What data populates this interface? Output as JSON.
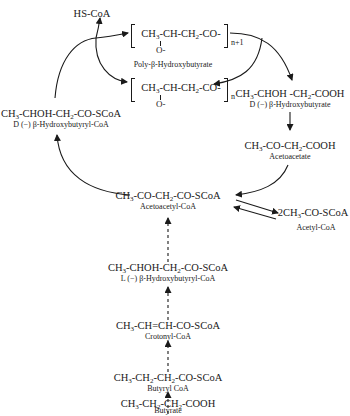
{
  "nodes": {
    "hs_coa": {
      "formula": "HS-CoA"
    },
    "phb_n1": {
      "formula_parts": [
        "CH",
        "3",
        "-CH-CH",
        "2",
        "-CO-"
      ],
      "subscript": "n+1",
      "substituent": "O-"
    },
    "phb_name": {
      "name": "Poly-β-Hydroxybutyrate"
    },
    "phb_n": {
      "formula_parts": [
        "CH",
        "3",
        "-CH-CH",
        "2",
        "-CO-"
      ],
      "subscript": "n",
      "substituent": "O-"
    },
    "d_hb": {
      "formula_parts": [
        "CH",
        "3",
        "-CHOH -CH",
        "2",
        "-COOH"
      ],
      "name": "D (−) β-Hydroxybutyrate"
    },
    "acetoacetate": {
      "formula_parts": [
        "CH",
        "3",
        "-CO-CH",
        "2",
        "-COOH"
      ],
      "name": "Acetoacetate"
    },
    "d_hb_coa": {
      "formula_parts": [
        "CH",
        "3",
        "-CHOH-CH",
        "2",
        "-CO-SCoA"
      ],
      "name": "D (−) β-Hydroxybutyryl-CoA"
    },
    "acetoacetyl_coa": {
      "formula_parts": [
        "CH",
        "3",
        "-CO-CH",
        "2",
        "-CO-SCoA"
      ],
      "name": "Acetoacetyl-CoA"
    },
    "acetyl_coa": {
      "formula_parts": [
        "2CH",
        "3",
        "-CO-SCoA"
      ],
      "name": "Acetyl-CoA"
    },
    "l_hb_coa": {
      "formula_parts": [
        "CH",
        "3",
        "-CHOH-CH",
        "2",
        "-CO-SCoA"
      ],
      "name": "L (−) β-Hydroxybutyryl-CoA"
    },
    "crotonyl_coa": {
      "formula_parts": [
        "CH",
        "3",
        "-CH=CH-CO-SCoA"
      ],
      "name": "Crotonyl-CoA"
    },
    "butyryl_coa": {
      "formula_parts": [
        "CH",
        "3",
        "-CH",
        "2",
        "-CH",
        "2",
        "-CO-SCoA"
      ],
      "name": "Butyryl CoA"
    },
    "butyrate": {
      "formula_parts": [
        "CH",
        "3",
        "-CH",
        "2",
        "-CH",
        "2",
        "-COOH"
      ],
      "name": "Butyrate"
    }
  },
  "edges": [
    {
      "from": "d_hb_coa",
      "to": "phb_n1",
      "style": "solid",
      "side_product": "HS-CoA"
    },
    {
      "from": "phb_n1",
      "to": "phb_n",
      "style": "solid"
    },
    {
      "from": "phb_n1",
      "to": "d_hb",
      "style": "solid"
    },
    {
      "from": "d_hb",
      "to": "acetoacetate",
      "style": "solid"
    },
    {
      "from": "acetoacetate",
      "to": "acetoacetyl_coa",
      "style": "solid"
    },
    {
      "from": "acetoacetyl_coa",
      "to": "d_hb_coa",
      "style": "solid"
    },
    {
      "from": "acetoacetyl_coa",
      "to": "acetyl_coa",
      "style": "solid-reversible"
    },
    {
      "from": "l_hb_coa",
      "to": "acetoacetyl_coa",
      "style": "dashed"
    },
    {
      "from": "crotonyl_coa",
      "to": "l_hb_coa",
      "style": "dashed"
    },
    {
      "from": "butyryl_coa",
      "to": "crotonyl_coa",
      "style": "dashed"
    },
    {
      "from": "butyrate",
      "to": "butyryl_coa",
      "style": "dashed"
    }
  ]
}
